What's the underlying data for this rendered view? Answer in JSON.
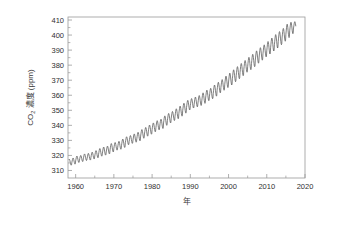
{
  "chart_data": {
    "type": "line",
    "title": "",
    "subtitle": "",
    "xlabel": "年",
    "ylabel": "CO₂ 濃度 (ppm)",
    "ylabel_parts": {
      "species": "CO",
      "subscript": "2",
      "concentration": "濃度",
      "unit": "(ppm)"
    },
    "xlim": [
      1958,
      2020
    ],
    "ylim": [
      305,
      412
    ],
    "xticks": [
      1960,
      1970,
      1980,
      1990,
      2000,
      2010,
      2020
    ],
    "xtick_labels": [
      "1960",
      "1970",
      "1980",
      "1990",
      "2000",
      "2010",
      "2020"
    ],
    "xminor_step": 5,
    "yticks": [
      310,
      320,
      330,
      340,
      350,
      360,
      370,
      380,
      390,
      400,
      410
    ],
    "ytick_labels": [
      "310",
      "320",
      "330",
      "340",
      "350",
      "360",
      "370",
      "380",
      "390",
      "400",
      "410"
    ],
    "grid": false,
    "legend": null,
    "legend_position": "none",
    "series": [
      {
        "name": "Mauna Loa monthly mean CO₂",
        "line_color": "#4a4a4a",
        "line_width": 0.7,
        "x_start": 1958.2,
        "x_end": 2017.6,
        "samples_per_year": 12,
        "seasonal_amplitude_ppm": 3.1,
        "seasonal_peak_month": 5,
        "trend_anchors": [
          {
            "year": 1958,
            "ppm": 315.0
          },
          {
            "year": 1960,
            "ppm": 316.9
          },
          {
            "year": 1965,
            "ppm": 320.0
          },
          {
            "year": 1970,
            "ppm": 325.7
          },
          {
            "year": 1975,
            "ppm": 331.1
          },
          {
            "year": 1980,
            "ppm": 338.7
          },
          {
            "year": 1985,
            "ppm": 346.0
          },
          {
            "year": 1990,
            "ppm": 354.4
          },
          {
            "year": 1995,
            "ppm": 360.8
          },
          {
            "year": 2000,
            "ppm": 369.5
          },
          {
            "year": 2005,
            "ppm": 379.8
          },
          {
            "year": 2010,
            "ppm": 389.9
          },
          {
            "year": 2015,
            "ppm": 400.8
          },
          {
            "year": 2017.6,
            "ppm": 406.5
          }
        ],
        "annual_min_ppm": [
          313.5,
          314.2,
          315.3,
          315.9,
          316.6,
          316.9,
          317.6,
          318.4,
          319.5,
          320.2,
          321.0,
          322.3,
          323.5,
          324.1,
          325.3,
          327.1,
          328.0,
          328.8,
          329.7,
          331.4,
          332.8,
          334.1,
          335.7,
          337.0,
          337.9,
          340.0,
          341.6,
          343.2,
          344.4,
          346.1,
          348.1,
          350.2,
          351.5,
          352.3,
          353.2,
          354.6,
          356.4,
          357.7,
          359.4,
          361.6,
          363.3,
          365.1,
          366.8,
          369.0,
          371.0,
          373.0,
          375.3,
          377.0,
          379.0,
          381.3,
          383.3,
          385.5,
          387.4,
          389.4,
          391.4,
          393.6,
          395.9,
          398.3,
          400.9,
          403.3
        ],
        "annual_max_ppm": [
          317.5,
          318.3,
          319.6,
          320.0,
          321.0,
          321.4,
          322.2,
          323.2,
          324.6,
          325.6,
          326.2,
          327.9,
          328.6,
          329.4,
          330.9,
          332.4,
          333.2,
          334.3,
          335.4,
          337.2,
          338.6,
          340.2,
          341.6,
          343.1,
          344.1,
          346.3,
          347.9,
          349.2,
          351.0,
          352.8,
          354.7,
          356.6,
          357.8,
          358.8,
          359.8,
          361.6,
          363.4,
          364.6,
          366.8,
          368.6,
          370.4,
          372.7,
          374.7,
          376.9,
          379.0,
          381.1,
          383.1,
          385.2,
          387.2,
          389.5,
          391.6,
          393.5,
          395.7,
          398.0,
          400.3,
          402.3,
          404.4,
          407.2,
          408.5,
          408.9
        ],
        "first_year": 1958,
        "last_value_ppm": 408.9,
        "first_value_ppm": 315.0
      }
    ]
  },
  "figure": {
    "background_color": "#ffffff",
    "frame_color": "#9a9a9a",
    "tick_color": "#9a9a9a",
    "text_color": "#2f2f2f"
  }
}
